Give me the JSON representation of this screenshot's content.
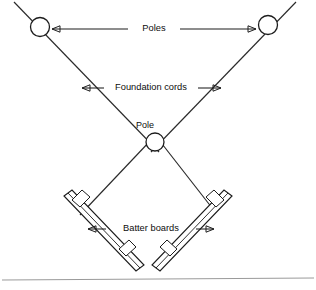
{
  "figure": {
    "background_color": "#ffffff",
    "line_color": "#1c1c1c",
    "rule_color": "#9a9a9a",
    "width": 316,
    "height": 290
  },
  "labels": {
    "poles": "Poles",
    "foundation_cords": "Foundation cords",
    "pole": "Pole",
    "batter_boards": "Batter boards"
  },
  "elements": {
    "pole_top_left": "pole",
    "pole_top_right": "pole",
    "pole_center": "pole",
    "cord_left": "foundation cord",
    "cord_right": "foundation cord",
    "board_left": "batter board",
    "board_right": "batter board",
    "stakes": 4
  }
}
